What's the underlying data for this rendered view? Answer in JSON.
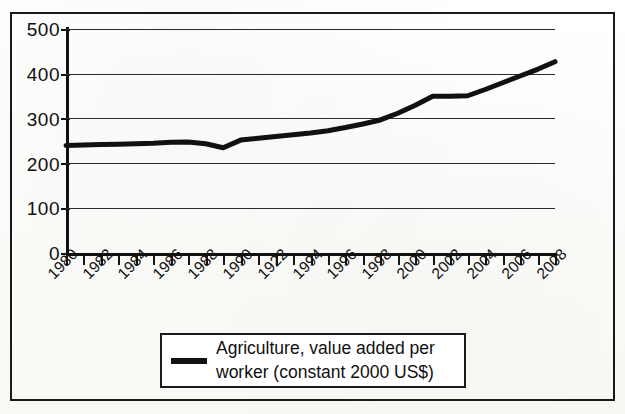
{
  "chart_data": {
    "type": "line",
    "title": "",
    "subtitle": "",
    "xlabel": "",
    "ylabel": "",
    "ylim": [
      0,
      500
    ],
    "ytick_labels": [
      "0",
      "100",
      "200",
      "300",
      "400",
      "500"
    ],
    "ytick_values": [
      0,
      100,
      200,
      300,
      400,
      500
    ],
    "grid": true,
    "legend_position": "bottom",
    "x": [
      1980,
      1981,
      1982,
      1983,
      1984,
      1985,
      1986,
      1987,
      1988,
      1989,
      1990,
      1991,
      1992,
      1993,
      1994,
      1995,
      1996,
      1997,
      1998,
      1999,
      2000,
      2001,
      2002,
      2003,
      2004,
      2005,
      2006,
      2007,
      2008
    ],
    "xtick_labels": [
      "1980",
      "1982",
      "1984",
      "1986",
      "1988",
      "1990",
      "1922",
      "1994",
      "1996",
      "1998",
      "2000",
      "2002",
      "2004",
      "2006",
      "2008"
    ],
    "xtick_values": [
      1980,
      1982,
      1984,
      1986,
      1988,
      1990,
      1992,
      1994,
      1996,
      1998,
      2000,
      2002,
      2004,
      2006,
      2008
    ],
    "series": [
      {
        "name": "Agriculture, value added per worker (constant 2000 US$)",
        "values": [
          240,
          241,
          242,
          243,
          244,
          245,
          247,
          248,
          244,
          235,
          252,
          256,
          260,
          264,
          268,
          273,
          280,
          288,
          297,
          312,
          330,
          350,
          350,
          351,
          365,
          380,
          395,
          410,
          427
        ],
        "color": "#111111",
        "line_width": 5
      }
    ]
  },
  "legend": {
    "entries": [
      {
        "label_line1": "Agriculture, value added per",
        "label_line2": "worker (constant 2000 US$)",
        "swatch_color": "#111111"
      }
    ]
  },
  "colors": {
    "line": "#111111",
    "grid": "#2b2b2b",
    "axis": "#111111",
    "frame": "#1a1a1a",
    "background": "#fdfdfb",
    "text": "#111111"
  }
}
